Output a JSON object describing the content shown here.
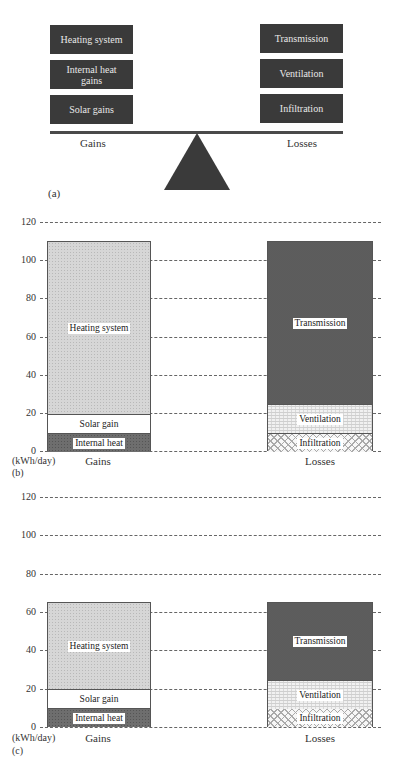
{
  "diagram_a": {
    "panel_label": "(a)",
    "gains": {
      "label": "Gains",
      "items": [
        "Heating system",
        "Internal heat gains",
        "Solar gains"
      ]
    },
    "losses": {
      "label": "Losses",
      "items": [
        "Transmission",
        "Ventilation",
        "Infiltration"
      ]
    },
    "colors": {
      "box": "#3a3a3a",
      "box_text": "#e8e8e8",
      "fulcrum": "#3a3a3a"
    }
  },
  "chart_data": [
    {
      "panel_label": "(b)",
      "type": "bar",
      "stacked": true,
      "title": "",
      "xlabel": "",
      "ylabel": "(kWh/day)",
      "ylim": [
        0,
        120
      ],
      "yticks": [
        0,
        20,
        40,
        60,
        80,
        100,
        120
      ],
      "grid": true,
      "categories": [
        "Gains",
        "Losses"
      ],
      "stacks": [
        {
          "category": "Gains",
          "segments": [
            {
              "name": "Internal heat",
              "value": 10,
              "pattern": "internal"
            },
            {
              "name": "Solar gain",
              "value": 10,
              "pattern": "solar"
            },
            {
              "name": "Heating system",
              "value": 90,
              "pattern": "heating"
            }
          ],
          "total": 110
        },
        {
          "category": "Losses",
          "segments": [
            {
              "name": "Infiltration",
              "value": 10,
              "pattern": "infiltration"
            },
            {
              "name": "Ventilation",
              "value": 15,
              "pattern": "ventilation"
            },
            {
              "name": "Transmission",
              "value": 85,
              "pattern": "transmission"
            }
          ],
          "total": 110
        }
      ]
    },
    {
      "panel_label": "(c)",
      "type": "bar",
      "stacked": true,
      "title": "",
      "xlabel": "",
      "ylabel": "(kWh/day)",
      "ylim": [
        0,
        120
      ],
      "yticks": [
        0,
        20,
        40,
        60,
        80,
        100,
        120
      ],
      "grid": true,
      "categories": [
        "Gains",
        "Losses"
      ],
      "stacks": [
        {
          "category": "Gains",
          "segments": [
            {
              "name": "Internal heat",
              "value": 10,
              "pattern": "internal"
            },
            {
              "name": "Solar gain",
              "value": 10,
              "pattern": "solar"
            },
            {
              "name": "Heating system",
              "value": 45,
              "pattern": "heating"
            }
          ],
          "total": 65
        },
        {
          "category": "Losses",
          "segments": [
            {
              "name": "Infiltration",
              "value": 10,
              "pattern": "infiltration"
            },
            {
              "name": "Ventilation",
              "value": 15,
              "pattern": "ventilation"
            },
            {
              "name": "Transmission",
              "value": 40,
              "pattern": "transmission"
            }
          ],
          "total": 65
        }
      ]
    }
  ]
}
